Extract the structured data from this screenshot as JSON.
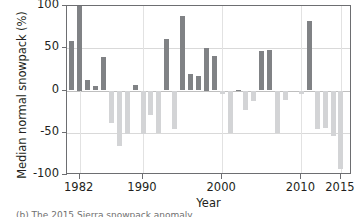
{
  "chart_data": {
    "type": "bar",
    "title": "",
    "xlabel": "Year",
    "ylabel": "Median normal snowpack (%)",
    "xlim": [
      1980.4,
      2016.4
    ],
    "ylim": [
      -100,
      100
    ],
    "ytick_values": [
      100,
      50,
      0,
      -50,
      -100
    ],
    "ytick_labels": [
      "100",
      "50",
      "0",
      "-50",
      "-100"
    ],
    "xtick_values": [
      1982,
      1990,
      2000,
      2010,
      2015
    ],
    "xtick_labels": [
      "1982",
      "1990",
      "2000",
      "2010",
      "2015"
    ],
    "grid": "horizontal and vertical at ticks",
    "legend": null,
    "bar_colors": {
      "positive": "#808285",
      "negative": "#d3d4d6"
    },
    "categories": [
      1981,
      1982,
      1983,
      1984,
      1985,
      1986,
      1987,
      1988,
      1989,
      1990,
      1991,
      1992,
      1993,
      1994,
      1995,
      1996,
      1997,
      1998,
      1999,
      2000,
      2001,
      2002,
      2003,
      2004,
      2005,
      2006,
      2007,
      2008,
      2009,
      2010,
      2011,
      2012,
      2013,
      2014,
      2015
    ],
    "values": [
      58,
      100,
      13,
      5,
      40,
      -39,
      -66,
      -52,
      6,
      -52,
      -29,
      -50,
      61,
      -46,
      88,
      20,
      17,
      50,
      41,
      -4,
      -50,
      1,
      -23,
      -12,
      47,
      48,
      -50,
      -11,
      0,
      -4,
      82,
      -45,
      -44,
      -54,
      -93
    ]
  },
  "axes": {
    "ylabel": "Median normal snowpack (%)",
    "xlabel": "Year"
  },
  "caption": "(b) The 2015 Sierra snowpack anomaly"
}
